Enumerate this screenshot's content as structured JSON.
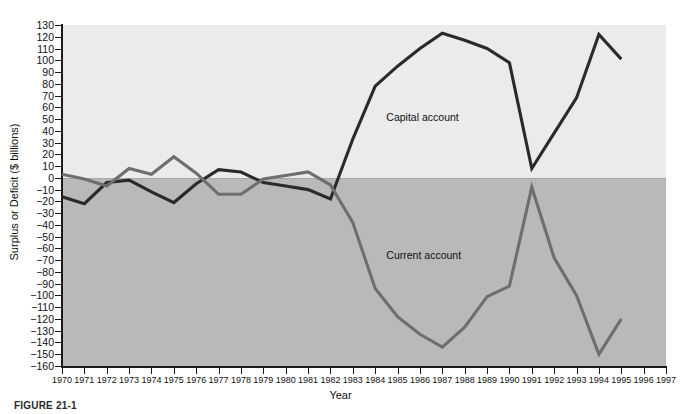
{
  "figure": {
    "caption": "FIGURE 21-1"
  },
  "axes": {
    "ylabel": "Surplus or Deficit ($ billions)",
    "xlabel": "Year",
    "yticks": [
      130,
      120,
      110,
      100,
      90,
      80,
      70,
      60,
      50,
      40,
      30,
      20,
      10,
      0,
      -10,
      -20,
      -30,
      -40,
      -50,
      -60,
      -70,
      -80,
      -90,
      -100,
      -110,
      -120,
      -130,
      -140,
      -150,
      -160
    ],
    "ytick_labels": [
      "130",
      "120",
      "110",
      "100",
      "90",
      "80",
      "70",
      "60",
      "50",
      "40",
      "30",
      "20",
      "10",
      "0",
      "−10",
      "−20",
      "−30",
      "−40",
      "−50",
      "−60",
      "−70",
      "−80",
      "−90",
      "−100",
      "−110",
      "−120",
      "−130",
      "−140",
      "−150",
      "−160"
    ],
    "xticks": [
      1970,
      1971,
      1972,
      1973,
      1974,
      1975,
      1976,
      1977,
      1978,
      1979,
      1980,
      1981,
      1982,
      1983,
      1984,
      1985,
      1986,
      1987,
      1988,
      1989,
      1990,
      1991,
      1992,
      1993,
      1994,
      1995,
      1996,
      1997
    ]
  },
  "series_labels": {
    "capital": "Capital account",
    "current": "Current account"
  },
  "colors": {
    "capital_line": "#2a2a2a",
    "current_line": "#6e6e6e",
    "panel_positive": "#ebebeb",
    "panel_negative": "#b9b9b9",
    "axis": "#1a1a1a"
  },
  "chart_data": {
    "type": "line",
    "title": "",
    "subtitle": "",
    "xlabel": "Year",
    "ylabel": "Surplus or Deficit ($ billions)",
    "xlim": [
      1970,
      1997
    ],
    "ylim": [
      -160,
      130
    ],
    "grid": false,
    "legend": "inline-annotations",
    "annotations": [
      {
        "text": "Capital account",
        "x": 1984.5,
        "y": 52
      },
      {
        "text": "Current account",
        "x": 1984.5,
        "y": -66
      }
    ],
    "x": [
      1970,
      1971,
      1972,
      1973,
      1974,
      1975,
      1976,
      1977,
      1978,
      1979,
      1980,
      1981,
      1982,
      1983,
      1984,
      1985,
      1986,
      1987,
      1988,
      1989,
      1990,
      1991,
      1992,
      1993,
      1994,
      1995
    ],
    "series": [
      {
        "name": "Capital account",
        "color": "#2a2a2a",
        "values": [
          -16,
          -22,
          -4,
          -2,
          -12,
          -21,
          -5,
          7,
          5,
          -4,
          -7,
          -10,
          -18,
          33,
          78,
          95,
          110,
          123,
          117,
          110,
          98,
          8,
          38,
          68,
          122,
          101
        ]
      },
      {
        "name": "Current account",
        "color": "#6e6e6e",
        "values": [
          3,
          -1,
          -7,
          8,
          3,
          18,
          4,
          -14,
          -14,
          -1,
          2,
          5,
          -6,
          -38,
          -94,
          -118,
          -133,
          -144,
          -127,
          -101,
          -92,
          -8,
          -68,
          -100,
          -150,
          -120
        ]
      }
    ]
  }
}
